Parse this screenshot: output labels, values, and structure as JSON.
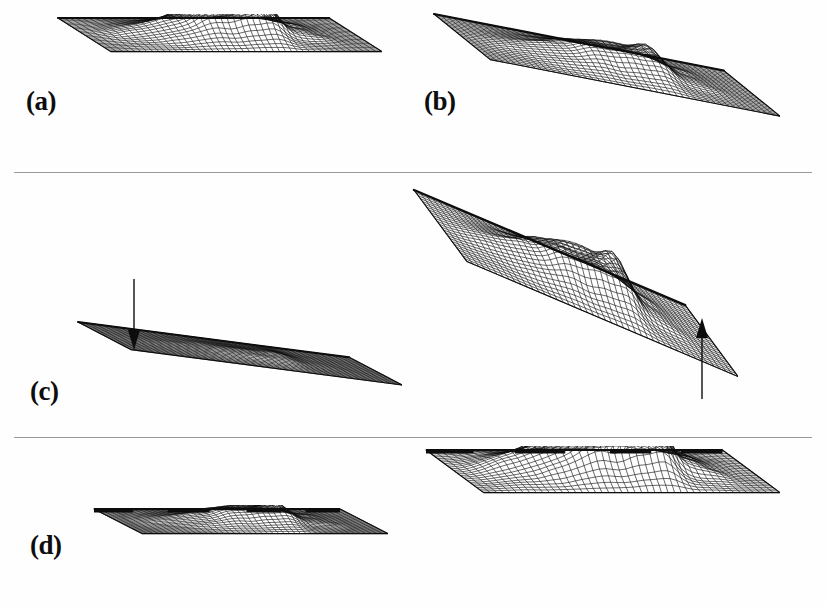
{
  "figure": {
    "background_color": "#fefefe",
    "ink_color": "#0d0d0d",
    "divider_color": "#9a9a9a",
    "width": 826,
    "height": 607
  },
  "dividers": [
    {
      "name": "divider-1",
      "y": 172
    },
    {
      "name": "divider-2",
      "y": 437
    }
  ],
  "labels": [
    {
      "id": "a",
      "text": "(a)",
      "x": 26,
      "y": 88
    },
    {
      "id": "b",
      "text": "(b)",
      "x": 424,
      "y": 88
    },
    {
      "id": "c",
      "text": "(c)",
      "x": 30,
      "y": 378
    },
    {
      "id": "d",
      "text": "(d)",
      "x": 30,
      "y": 532
    }
  ],
  "annotations": [
    {
      "name": "down-arrow",
      "glyph": "arrow-down-icon",
      "meaning": "vertical scale reduced",
      "x": 126,
      "y": 278,
      "length": 72,
      "direction": "down"
    },
    {
      "name": "up-arrow",
      "glyph": "arrow-up-icon",
      "meaning": "vertical scale increased",
      "x": 694,
      "y": 318,
      "length": 82,
      "direction": "up"
    }
  ],
  "chart_data": {
    "type": "surface",
    "xlabel": "",
    "ylabel": "",
    "grid": false,
    "legend_position": "none",
    "shared_terrain": {
      "description": "A single terrain height-field rendered six times with differing vertical exaggeration and baseline tilt",
      "nx": 46,
      "ny": 26,
      "peaks": [
        {
          "cx": 0.3,
          "cy": 0.48,
          "amp": 0.42,
          "sx": 0.055,
          "sy": 0.22
        },
        {
          "cx": 0.39,
          "cy": 0.52,
          "amp": 0.78,
          "sx": 0.05,
          "sy": 0.24
        },
        {
          "cx": 0.46,
          "cy": 0.5,
          "amp": 0.86,
          "sx": 0.045,
          "sy": 0.22
        },
        {
          "cx": 0.53,
          "cy": 0.46,
          "amp": 0.7,
          "sx": 0.042,
          "sy": 0.2
        },
        {
          "cx": 0.6,
          "cy": 0.5,
          "amp": 1.0,
          "sx": 0.06,
          "sy": 0.26
        },
        {
          "cx": 0.66,
          "cy": 0.52,
          "amp": 0.92,
          "sx": 0.04,
          "sy": 0.24
        },
        {
          "cx": 0.2,
          "cy": 0.52,
          "amp": 0.3,
          "sx": 0.075,
          "sy": 0.26
        },
        {
          "cx": 0.75,
          "cy": 0.54,
          "amp": 0.3,
          "sx": 0.06,
          "sy": 0.24
        },
        {
          "cx": 0.84,
          "cy": 0.52,
          "amp": 0.16,
          "sx": 0.055,
          "sy": 0.22
        },
        {
          "cx": 0.12,
          "cy": 0.5,
          "amp": 0.11,
          "sx": 0.06,
          "sy": 0.24
        }
      ],
      "roughness": 0.085
    },
    "panels": [
      {
        "id": "a",
        "label": "(a)",
        "name": "plot-a-flat-baseline-normal-scale",
        "x": 52,
        "y": 14,
        "w": 330,
        "h": 112,
        "vertical_exaggeration": 1.0,
        "tilt": 0.0,
        "depth_x": -0.16,
        "depth_y": -0.3,
        "baseline": "flat",
        "baseline_thickness": 2.2
      },
      {
        "id": "b",
        "label": "(b)",
        "name": "plot-b-tilted-baseline-normal-scale",
        "x": 428,
        "y": 10,
        "w": 352,
        "h": 152,
        "vertical_exaggeration": 1.05,
        "tilt": 0.6,
        "depth_x": -0.16,
        "depth_y": -0.3,
        "baseline": "tilted",
        "baseline_thickness": 2.2
      },
      {
        "id": "c-left",
        "label": "(c)",
        "name": "plot-c-left-tilted-compressed",
        "x": 72,
        "y": 318,
        "w": 330,
        "h": 92,
        "vertical_exaggeration": 0.34,
        "tilt": 0.62,
        "depth_x": -0.16,
        "depth_y": -0.3,
        "baseline": "tilted",
        "baseline_thickness": 2.0
      },
      {
        "id": "c-right",
        "label": "(c)",
        "name": "plot-c-right-tilted-exaggerated",
        "x": 408,
        "y": 186,
        "w": 330,
        "h": 238,
        "vertical_exaggeration": 1.7,
        "tilt": 0.78,
        "depth_x": -0.16,
        "depth_y": -0.3,
        "baseline": "tilted",
        "baseline_thickness": 2.4
      },
      {
        "id": "d-left",
        "label": "(d)",
        "name": "plot-d-left-flat-compressed",
        "x": 88,
        "y": 505,
        "w": 300,
        "h": 82,
        "vertical_exaggeration": 0.62,
        "tilt": 0.0,
        "depth_x": -0.16,
        "depth_y": -0.3,
        "baseline": "flat-segmented",
        "baseline_thickness": 4.0
      },
      {
        "id": "d-right",
        "label": "(d)",
        "name": "plot-d-right-flat-exaggerated",
        "x": 420,
        "y": 446,
        "w": 360,
        "h": 142,
        "vertical_exaggeration": 1.55,
        "tilt": 0.0,
        "depth_x": -0.16,
        "depth_y": -0.3,
        "baseline": "flat-segmented",
        "baseline_thickness": 4.0
      }
    ]
  }
}
